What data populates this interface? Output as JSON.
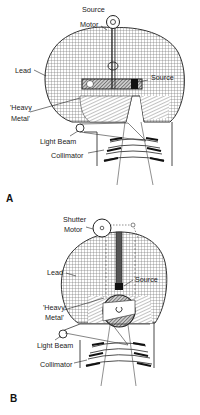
{
  "figure": {
    "panels": [
      {
        "id": "A",
        "panel_label": "A",
        "labels": {
          "motor_line1": "Source",
          "motor_line2": "Motor",
          "lead": "Lead",
          "source": "Source",
          "heavy_metal_line1": "'Heavy",
          "heavy_metal_line2": "Metal'",
          "light_beam": "Light Beam",
          "collimator": "Collimator"
        }
      },
      {
        "id": "B",
        "panel_label": "B",
        "labels": {
          "motor_line1": "Shutter",
          "motor_line2": "Motor",
          "lead": "Lead",
          "source": "Source",
          "heavy_metal_line1": "'Heavy",
          "heavy_metal_line2": "Metal'",
          "light_beam": "Light Beam",
          "collimator": "Collimator"
        }
      }
    ],
    "colors": {
      "line": "#333333",
      "source_fill": "#111111",
      "background": "#ffffff"
    }
  }
}
